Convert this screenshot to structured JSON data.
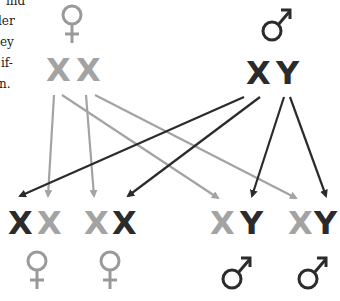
{
  "text_fragments": [
    "ind",
    "ler",
    "ey",
    "if-",
    "n."
  ],
  "colors": {
    "mother": "#a3a3a3",
    "father": "#2b2b2b",
    "female_symbol": "#9a9a9a",
    "male_symbol": "#2b2b2b"
  },
  "parents": {
    "mother": {
      "symbol": "female",
      "chromosomes": [
        "X",
        "X"
      ]
    },
    "father": {
      "symbol": "male",
      "chromosomes": [
        "X",
        "Y"
      ]
    }
  },
  "offspring": [
    {
      "chromosomes": [
        "X",
        "X"
      ],
      "origin": [
        "father",
        "mother"
      ],
      "symbol": "female"
    },
    {
      "chromosomes": [
        "X",
        "X"
      ],
      "origin": [
        "mother",
        "father"
      ],
      "symbol": "female"
    },
    {
      "chromosomes": [
        "X",
        "Y"
      ],
      "origin": [
        "mother",
        "father"
      ],
      "symbol": "male"
    },
    {
      "chromosomes": [
        "X",
        "Y"
      ],
      "origin": [
        "mother",
        "father"
      ],
      "symbol": "male"
    }
  ]
}
